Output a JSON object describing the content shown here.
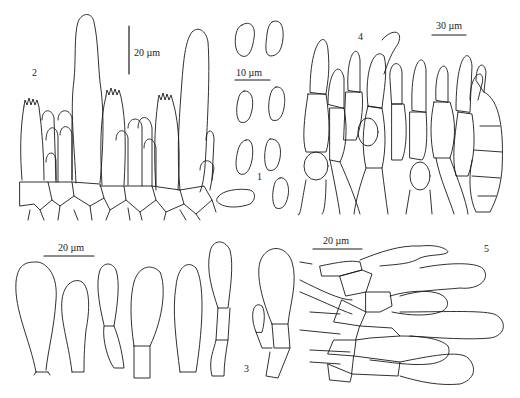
{
  "figure": {
    "panels": [
      {
        "id": "1",
        "label": "1",
        "description": "basidiospores",
        "scale_bar": "10 µm"
      },
      {
        "id": "2",
        "label": "2",
        "description": "basidia and cystidia of hymenium",
        "scale_bar": "20 µm"
      },
      {
        "id": "3",
        "label": "3",
        "description": "clavate cells / pileocystidia",
        "scale_bar": "20 µm"
      },
      {
        "id": "4",
        "label": "4",
        "description": "pileipellis hyphae",
        "scale_bar": "30 µm"
      },
      {
        "id": "5",
        "label": "5",
        "description": "caulocystidia / stipitipellis",
        "scale_bar": "20 µm"
      }
    ]
  }
}
